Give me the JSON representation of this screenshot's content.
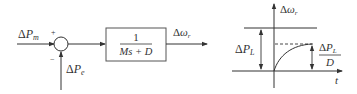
{
  "block_diagram": {
    "input_label": {
      "delta": "Δ",
      "symbol": "P",
      "sub": "m"
    },
    "sum_plus_sign": "+",
    "sum_minus_sign": "−",
    "feedback_label": {
      "delta": "Δ",
      "symbol": "P",
      "sub": "e"
    },
    "transfer_block": {
      "numerator": "1",
      "denominator": "Ms + D"
    },
    "output_label": {
      "delta": "Δ",
      "symbol": "ω",
      "sub": "r"
    }
  },
  "response_plot": {
    "y_axis_label": {
      "delta": "Δ",
      "symbol": "ω",
      "sub": "r"
    },
    "x_axis_label": "t",
    "step_label": {
      "delta": "Δ",
      "symbol": "P",
      "sub": "L"
    },
    "steady_state_label": {
      "num_delta": "Δ",
      "num_symbol": "P",
      "num_sub": "L",
      "den": "D"
    }
  },
  "colors": {
    "line": "#333333",
    "background": "#ffffff"
  }
}
